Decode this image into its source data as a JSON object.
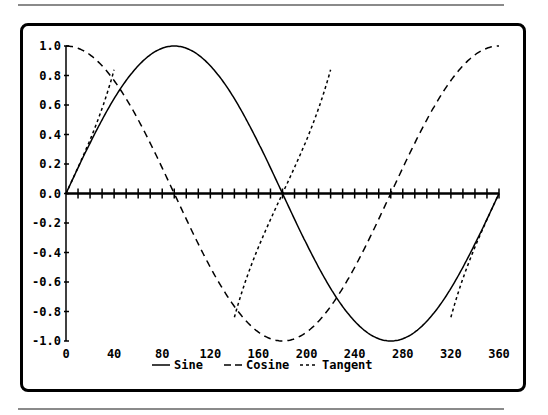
{
  "chart_data": {
    "type": "line",
    "title": "",
    "xlabel": "",
    "ylabel": "",
    "xlim": [
      0,
      360
    ],
    "ylim": [
      -1.0,
      1.0
    ],
    "x_ticks": [
      0,
      40,
      80,
      120,
      160,
      200,
      240,
      280,
      320,
      360
    ],
    "x_tick_labels": [
      "0",
      "40",
      "80",
      "120",
      "160",
      "200",
      "240",
      "280",
      "320",
      "360"
    ],
    "x_minor_tick_step": 10,
    "y_ticks": [
      1.0,
      0.8,
      0.6,
      0.4,
      0.2,
      0.0,
      -0.2,
      -0.4,
      -0.6,
      -0.8,
      -1.0
    ],
    "y_tick_labels": [
      "1.0",
      "0.8",
      "0.6",
      "0.4",
      "0.2",
      "0.0",
      "-0.2",
      "-0.4",
      "-0.6",
      "-0.8",
      "-1.0"
    ],
    "grid": false,
    "legend_position": "bottom-center",
    "x": [
      0,
      20,
      40,
      60,
      80,
      100,
      120,
      140,
      160,
      180,
      200,
      220,
      240,
      260,
      280,
      300,
      320,
      340,
      360
    ],
    "series": [
      {
        "name": "Sine",
        "style": "solid",
        "function": "sin(x)",
        "values": [
          0.0,
          0.34,
          0.64,
          0.87,
          0.98,
          0.98,
          0.87,
          0.64,
          0.34,
          0.0,
          -0.34,
          -0.64,
          -0.87,
          -0.98,
          -0.98,
          -0.87,
          -0.64,
          -0.34,
          0.0
        ]
      },
      {
        "name": "Cosine",
        "style": "dash",
        "function": "cos(x)",
        "values": [
          1.0,
          0.94,
          0.77,
          0.5,
          0.17,
          -0.17,
          -0.5,
          -0.77,
          -0.94,
          -1.0,
          -0.94,
          -0.77,
          -0.5,
          -0.17,
          0.17,
          0.5,
          0.77,
          0.94,
          1.0
        ]
      },
      {
        "name": "Tangent",
        "style": "dotted",
        "function": "tan(x)",
        "clip": [
          -0.85,
          0.85
        ],
        "segments": [
          {
            "x": [
              0,
              10,
              20,
              30,
              40
            ],
            "values": [
              0.0,
              0.18,
              0.36,
              0.58,
              0.84
            ]
          },
          {
            "x": [
              140,
              150,
              160,
              170,
              180,
              190,
              200,
              210,
              220
            ],
            "values": [
              -0.84,
              -0.58,
              -0.36,
              -0.18,
              0.0,
              0.18,
              0.36,
              0.58,
              0.84
            ]
          },
          {
            "x": [
              320,
              330,
              340,
              350,
              360
            ],
            "values": [
              -0.84,
              -0.58,
              -0.36,
              -0.18,
              0.0
            ]
          }
        ]
      }
    ]
  },
  "legend": {
    "items": [
      {
        "label": "Sine",
        "style": "solid"
      },
      {
        "label": "Cosine",
        "style": "dash"
      },
      {
        "label": "Tangent",
        "style": "dotted"
      }
    ]
  },
  "colors": {
    "line": "#000000",
    "frame": "#000000",
    "rule": "#8a8a8a",
    "background": "#ffffff"
  }
}
